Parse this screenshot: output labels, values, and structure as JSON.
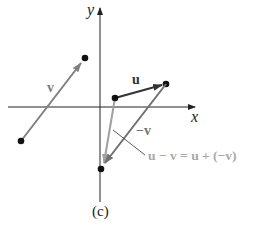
{
  "figure": {
    "caption": "(c)",
    "axes": {
      "x_label": "x",
      "y_label": "y"
    },
    "vectors": [
      {
        "name": "v",
        "label": "v",
        "from": [
          21,
          141
        ],
        "to": [
          85,
          58
        ],
        "color": "#808080"
      },
      {
        "name": "u",
        "label": "u",
        "from": [
          115,
          98
        ],
        "to": [
          166,
          84
        ],
        "color": "#333333"
      },
      {
        "name": "neg-v",
        "label": "−v",
        "from": [
          166,
          84
        ],
        "to": [
          103,
          165
        ],
        "color": "#707070"
      },
      {
        "name": "u-minus-v",
        "label": "u − v = u + (−v)",
        "from": [
          115,
          98
        ],
        "to": [
          103,
          165
        ],
        "color": "#a0a0a0"
      }
    ],
    "equation_label": "u − v = u + (−v)",
    "colors": {
      "axis": "#222222",
      "dot": "#111111",
      "light_label": "#a8a8a8"
    }
  }
}
